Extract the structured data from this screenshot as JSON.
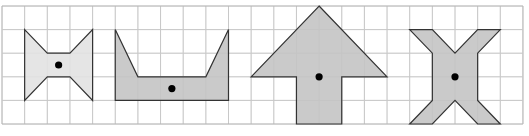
{
  "grid": {
    "origin_x": 2,
    "origin_y": 6,
    "cell_w": 22.65,
    "cell_h": 23.6,
    "cols": 23,
    "rows": 5,
    "line_color": "#c8c8c8",
    "border_color": "#b4b4b4"
  },
  "colors": {
    "outline": "#333333",
    "dot": "#000000"
  },
  "shapes": [
    {
      "name": "bowtie-shape",
      "fill": "#e2e2e2",
      "points": [
        [
          1,
          1
        ],
        [
          2,
          2
        ],
        [
          3,
          2
        ],
        [
          4,
          1
        ],
        [
          4,
          4
        ],
        [
          3,
          3
        ],
        [
          2,
          3
        ],
        [
          1,
          4
        ]
      ],
      "dot": [
        2.5,
        2.5
      ]
    },
    {
      "name": "bucket-shape",
      "fill": "#c4c4c4",
      "points": [
        [
          5,
          1
        ],
        [
          6,
          3
        ],
        [
          9,
          3
        ],
        [
          10,
          1
        ],
        [
          10,
          4
        ],
        [
          5,
          4
        ]
      ],
      "dot": [
        7.5,
        3.5
      ]
    },
    {
      "name": "arrow-shape",
      "fill": "#c4c4c4",
      "points": [
        [
          14,
          0
        ],
        [
          17,
          3
        ],
        [
          15,
          3
        ],
        [
          15,
          5
        ],
        [
          13,
          5
        ],
        [
          13,
          3
        ],
        [
          11,
          3
        ]
      ],
      "dot": [
        14,
        3
      ]
    },
    {
      "name": "x-shape",
      "fill": "#c4c4c4",
      "points": [
        [
          18,
          1
        ],
        [
          19,
          1
        ],
        [
          20,
          2
        ],
        [
          21,
          1
        ],
        [
          22,
          1
        ],
        [
          21,
          2
        ],
        [
          21,
          4
        ],
        [
          22,
          5
        ],
        [
          21,
          5
        ],
        [
          20,
          4
        ],
        [
          19,
          5
        ],
        [
          18,
          5
        ],
        [
          19,
          4
        ],
        [
          19,
          2
        ]
      ],
      "dot": [
        20,
        3
      ]
    }
  ]
}
